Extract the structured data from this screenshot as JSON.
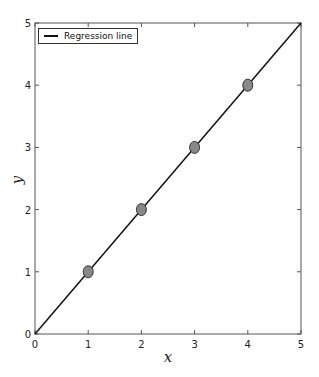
{
  "chart_data": {
    "type": "scatter",
    "title": "",
    "xlabel": "x",
    "ylabel": "y",
    "xlim": [
      0,
      5
    ],
    "ylim": [
      0,
      5
    ],
    "xticks": [
      0,
      1,
      2,
      3,
      4,
      5
    ],
    "yticks": [
      0,
      1,
      2,
      3,
      4,
      5
    ],
    "grid": false,
    "legend_position": "upper left",
    "series": [
      {
        "name": "data points",
        "type": "scatter",
        "x": [
          1,
          2,
          3,
          4
        ],
        "y": [
          1,
          2,
          3,
          4
        ],
        "color": "#888888"
      },
      {
        "name": "Regression line",
        "type": "line",
        "x": [
          0,
          5
        ],
        "y": [
          0,
          5
        ],
        "color": "#111111"
      }
    ]
  },
  "legend": {
    "label": "Regression line"
  },
  "axes": {
    "xlabel": "x",
    "ylabel": "y",
    "xtick_labels": [
      "0",
      "1",
      "2",
      "3",
      "4",
      "5"
    ],
    "ytick_labels": [
      "0",
      "1",
      "2",
      "3",
      "4",
      "5"
    ]
  }
}
